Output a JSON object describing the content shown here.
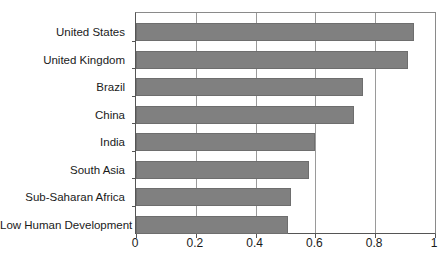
{
  "chart_data": {
    "type": "bar",
    "orientation": "horizontal",
    "title": "",
    "subtitle": "",
    "xlabel": "",
    "ylabel": "",
    "xlim": [
      0,
      1
    ],
    "ylim": null,
    "grid": true,
    "legend": null,
    "legend_position": "none",
    "bar_color": "#808080",
    "bar_edge_color": "#6e6e6e",
    "axis_color": "#555555",
    "gridline_color": "#9a9a9a",
    "background_color": "#ffffff",
    "categories": [
      "United States",
      "United Kingdom",
      "Brazil",
      "China",
      "India",
      "South Asia",
      "Sub-Saharan Africa",
      "Low Human Development"
    ],
    "values": [
      0.93,
      0.91,
      0.76,
      0.73,
      0.6,
      0.58,
      0.52,
      0.51
    ],
    "xticks": [
      0,
      0.2,
      0.4,
      0.6,
      0.8,
      1
    ],
    "xticklabels": [
      "0",
      "0.2",
      "0.4",
      "0.6",
      "0.8",
      "1"
    ]
  }
}
